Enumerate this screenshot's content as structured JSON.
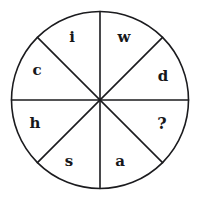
{
  "figure": {
    "type": "sector-wheel-puzzle",
    "background_color": "#ffffff",
    "stroke_color": "#1b1b1e",
    "text_color": "#17171a",
    "circle": {
      "center_x": 100,
      "center_y": 100,
      "radius": 88.5,
      "stroke_width": 1.6
    },
    "divider_count": 8,
    "divider_angles_deg": [
      0,
      45,
      90,
      135,
      180,
      225,
      270,
      315
    ],
    "sectors": [
      {
        "id": "sector-top-right",
        "label": "w",
        "angle_deg": 67.5,
        "x": 124,
        "y": 37
      },
      {
        "id": "sector-right-upper",
        "label": "d",
        "angle_deg": 22.5,
        "x": 163,
        "y": 76
      },
      {
        "id": "sector-right-lower",
        "label": "?",
        "angle_deg": 337.5,
        "x": 162,
        "y": 124
      },
      {
        "id": "sector-bottom-right",
        "label": "a",
        "angle_deg": 292.5,
        "x": 120,
        "y": 161
      },
      {
        "id": "sector-bottom-left",
        "label": "s",
        "angle_deg": 247.5,
        "x": 69,
        "y": 161
      },
      {
        "id": "sector-left-lower",
        "label": "h",
        "angle_deg": 202.5,
        "x": 35,
        "y": 123
      },
      {
        "id": "sector-left-upper",
        "label": "c",
        "angle_deg": 157.5,
        "x": 37,
        "y": 70
      },
      {
        "id": "sector-top-left",
        "label": "i",
        "angle_deg": 112.5,
        "x": 72,
        "y": 37
      }
    ],
    "missing_marker": "?"
  }
}
